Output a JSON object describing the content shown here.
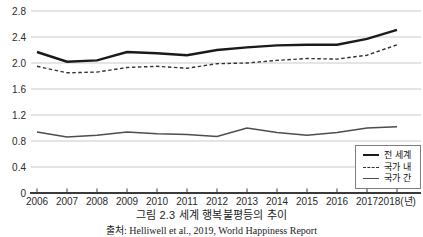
{
  "page": {
    "background": "#ffffff"
  },
  "chart_data": {
    "type": "line",
    "title": "그림 2.3 세계 행복불평등의 추이",
    "source": "출처: Helliwell et al., 2019, World Happiness Report",
    "categories": [
      "2006",
      "2007",
      "2008",
      "2009",
      "2010",
      "2011",
      "2012",
      "2013",
      "2014",
      "2015",
      "2016",
      "2017",
      "2018(년)"
    ],
    "x_axis_unit": "년",
    "y_ticks": [
      "0",
      "0.4",
      "0.8",
      "1.2",
      "1.6",
      "2.0",
      "2.4",
      "2.8"
    ],
    "ylim": [
      0,
      2.8
    ],
    "grid": "horizontal",
    "legend_position": "bottom-right-box",
    "series": [
      {
        "id": "total",
        "name": "전 세계",
        "style": "solid-thick",
        "color": "#1a1a1a",
        "values": [
          2.17,
          2.02,
          2.04,
          2.17,
          2.15,
          2.12,
          2.2,
          2.24,
          2.27,
          2.28,
          2.28,
          2.37,
          2.51
        ]
      },
      {
        "id": "within",
        "name": "국가 내",
        "style": "dashed",
        "color": "#333333",
        "values": [
          1.95,
          1.85,
          1.86,
          1.93,
          1.95,
          1.92,
          1.99,
          2.0,
          2.04,
          2.07,
          2.06,
          2.12,
          2.28
        ]
      },
      {
        "id": "between",
        "name": "국가 간",
        "style": "solid-thin",
        "color": "#4d4d4d",
        "values": [
          0.94,
          0.86,
          0.89,
          0.94,
          0.91,
          0.9,
          0.87,
          1.0,
          0.93,
          0.89,
          0.93,
          1.0,
          1.02
        ]
      }
    ],
    "colors": {
      "gridline": "#c9c9c9",
      "axis": "#3a3a3a",
      "tick_label": "#2a2a2a",
      "background": "#ffffff"
    }
  }
}
